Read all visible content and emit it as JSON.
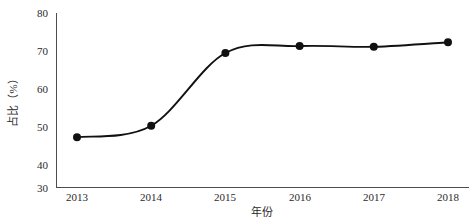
{
  "chart_data": {
    "type": "line",
    "title": "",
    "subtitle": "",
    "xlabel": "年份",
    "ylabel": "占比（%）",
    "categories": [
      "2013",
      "2014",
      "2015",
      "2016",
      "2017",
      "2018"
    ],
    "x": [
      2013,
      2014,
      2015,
      2016,
      2017,
      2018
    ],
    "values": [
      44.3,
      47.6,
      68.5,
      70.5,
      70.3,
      71.6
    ],
    "series": [
      {
        "name": "占比（%）",
        "values": [
          44.3,
          47.6,
          68.5,
          70.5,
          70.3,
          71.6
        ]
      }
    ],
    "xlim": [
      2013,
      2018
    ],
    "ylim": [
      30,
      80
    ],
    "yticks": [
      30,
      40,
      50,
      60,
      70,
      80
    ],
    "ytick_labels": [
      "30",
      "40",
      "50",
      "60",
      "70",
      "80"
    ],
    "xticks": [
      2013,
      2014,
      2015,
      2016,
      2017,
      2018
    ],
    "xtick_labels": [
      "2013",
      "2014",
      "2015",
      "2016",
      "2017",
      "2018"
    ],
    "grid": false,
    "legend": false,
    "legend_position": "none",
    "interpolation": "smooth",
    "line_color": "#111111",
    "marker_color": "#111111",
    "marker_shape": "circle",
    "axis_color": "#4d4d4d",
    "background_color": "#ffffff",
    "annotations": []
  },
  "axes": {
    "y_title": "占比（%）",
    "x_title": "年份"
  }
}
